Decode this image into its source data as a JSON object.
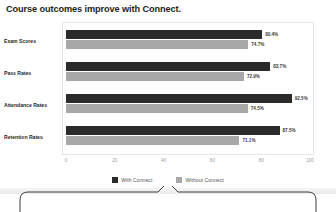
{
  "chart_data": {
    "type": "bar",
    "orientation": "horizontal",
    "title": "Course outcomes improve with Connect.",
    "xlabel": "",
    "ylabel": "",
    "xlim": [
      0,
      100
    ],
    "grid": false,
    "legend_position": "bottom",
    "categories": [
      "Exam Scores",
      "Pass Rates",
      "Attendance Rates",
      "Retention Rates"
    ],
    "xticks": [
      "0",
      "20",
      "40",
      "60",
      "80",
      "100"
    ],
    "series": [
      {
        "name": "With Connect",
        "color": "#2b2b2b",
        "values": [
          80.4,
          83.7,
          92.5,
          87.5
        ],
        "labels": [
          "80.4%",
          "83.7%",
          "92.5%",
          "87.5%"
        ]
      },
      {
        "name": "Without Connect",
        "color": "#a8a8a8",
        "values": [
          74.7,
          72.9,
          74.5,
          71.1
        ],
        "labels": [
          "74.7%",
          "72.9%",
          "74.5%",
          "71.1%"
        ]
      }
    ]
  },
  "callout": {
    "pointer_target": "With Connect",
    "text": ""
  }
}
